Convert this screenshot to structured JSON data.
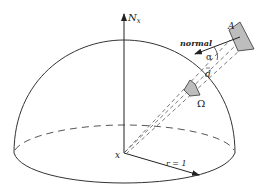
{
  "diagram": {
    "labels": {
      "normal_axis": "N",
      "normal_axis_sub": "x",
      "patch_area": "A",
      "normal": "normal",
      "angle": "α",
      "distance": "d",
      "solid_angle": "Ω",
      "origin": "x",
      "radius": "r = 1"
    },
    "colors": {
      "stroke": "#333333",
      "patch_fill": "#bdbdbd",
      "background": "#ffffff"
    },
    "elements": [
      "hemisphere-outline",
      "equator-dashed-back",
      "equator-solid-front",
      "normal-axis-arrow",
      "radius-arrow",
      "dashed-projection-lines",
      "patch-A",
      "patch-omega",
      "surface-normal-arrow",
      "angle-arc"
    ]
  }
}
